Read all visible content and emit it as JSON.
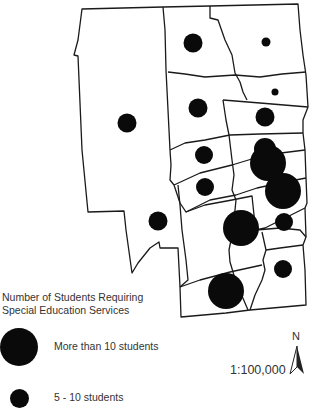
{
  "map": {
    "symbol_color": "#0a0a0a",
    "boundary_color": "#1a1a1a",
    "symbols": [
      {
        "cx": 193,
        "cy": 43,
        "r": 9.5,
        "class": "5-10"
      },
      {
        "cx": 266,
        "cy": 42,
        "r": 4.5,
        "class": "small"
      },
      {
        "cx": 127,
        "cy": 123,
        "r": 9.5,
        "class": "5-10"
      },
      {
        "cx": 198,
        "cy": 108,
        "r": 9.5,
        "class": "5-10"
      },
      {
        "cx": 275,
        "cy": 92,
        "r": 3.5,
        "class": "small"
      },
      {
        "cx": 265,
        "cy": 117,
        "r": 9.5,
        "class": "5-10"
      },
      {
        "cx": 204,
        "cy": 155,
        "r": 9,
        "class": "5-10"
      },
      {
        "cx": 265,
        "cy": 149,
        "r": 11,
        "class": "more-than-10"
      },
      {
        "cx": 268,
        "cy": 163,
        "r": 18,
        "class": "more-than-10"
      },
      {
        "cx": 283,
        "cy": 191,
        "r": 18,
        "class": "more-than-10"
      },
      {
        "cx": 205,
        "cy": 187,
        "r": 9,
        "class": "5-10"
      },
      {
        "cx": 158,
        "cy": 221,
        "r": 9.5,
        "class": "5-10"
      },
      {
        "cx": 241,
        "cy": 228,
        "r": 18,
        "class": "more-than-10"
      },
      {
        "cx": 284,
        "cy": 222,
        "r": 9,
        "class": "5-10"
      },
      {
        "cx": 283,
        "cy": 269,
        "r": 9,
        "class": "5-10"
      },
      {
        "cx": 226,
        "cy": 291,
        "r": 18,
        "class": "more-than-10"
      }
    ]
  },
  "legend": {
    "title_line1": "Number of Students Requiring",
    "title_line2": "Special Education Services",
    "items": [
      {
        "label": "More than 10 students",
        "size": "large"
      },
      {
        "label": "5 - 10 students",
        "size": "small"
      }
    ]
  },
  "scale": {
    "text": "1:100,000"
  },
  "north_arrow": {
    "label": "N"
  }
}
